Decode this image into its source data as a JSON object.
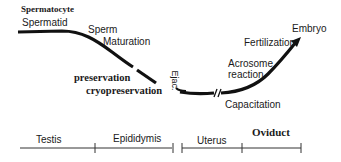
{
  "diagram": {
    "stage_labels": {
      "spermatocyte": "Spermatocyte",
      "spermatid": "Spermatid",
      "sperm_maturation_line1": "Sperm",
      "sperm_maturation_line2": "Maturation",
      "preservation": "preservation",
      "cryopreservation": "cryopreservation",
      "ejaculation": "Ejac.",
      "capacitation": "Capacitation",
      "acrosome_reaction_line1": "Acrosome",
      "acrosome_reaction_line2": "reaction",
      "fertilization": "Fertilization",
      "embryo": "Embryo"
    },
    "timeline": {
      "segments": [
        {
          "label": "Testis"
        },
        {
          "label": "Epididymis"
        },
        {
          "label": "Uterus"
        },
        {
          "label": "Oviduct"
        }
      ]
    },
    "colors": {
      "line": "#111111",
      "axis": "#333333",
      "text": "#1a1a1a"
    }
  }
}
